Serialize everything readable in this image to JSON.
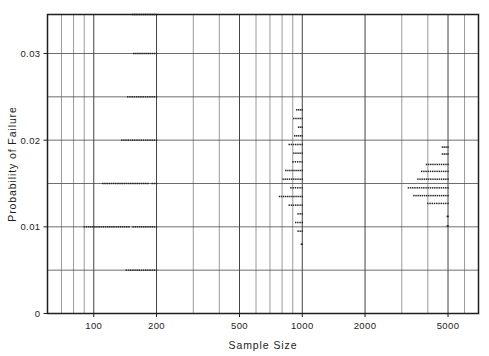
{
  "figure": {
    "name": "probability-of-failure-vs-sample-size-scatter"
  },
  "chart_data": {
    "type": "scatter",
    "title": "",
    "xlabel": "Sample Size",
    "ylabel": "Probability of Failure",
    "xscale": "log",
    "yscale": "linear",
    "xlim": [
      60,
      7000
    ],
    "ylim": [
      0,
      0.0345
    ],
    "grid": true,
    "legend": null,
    "x_ticks_labeled": [
      100,
      200,
      500,
      1000,
      2000,
      5000
    ],
    "x_tick_labels": [
      "100",
      "200",
      "500",
      "1000",
      "2000",
      "5000"
    ],
    "x_gridlines_minor": [
      70,
      80,
      90,
      100,
      200,
      300,
      400,
      500,
      600,
      700,
      800,
      900,
      1000,
      2000,
      3000,
      4000,
      5000,
      6000
    ],
    "y_ticks_labeled": [
      0,
      0.01,
      0.02,
      0.03
    ],
    "y_tick_labels": [
      "0",
      "0.01",
      "0.02",
      "0.03"
    ],
    "y_gridlines": [
      0,
      0.005,
      0.01,
      0.015,
      0.02,
      0.025,
      0.03
    ],
    "marker": "small-square-dot",
    "marker_color": "#262626",
    "clusters": [
      {
        "name": "cluster-n200",
        "x_right_edge": 200,
        "rows": [
          {
            "p": 0.0345,
            "x_start": 150,
            "x_end": 200
          },
          {
            "p": 0.03,
            "x_start": 152,
            "x_end": 200
          },
          {
            "p": 0.025,
            "x_start": 142,
            "x_end": 200
          },
          {
            "p": 0.02,
            "x_start": 133,
            "x_end": 200
          },
          {
            "p": 0.015,
            "x_start": 108,
            "x_end": 200
          },
          {
            "p": 0.01,
            "x_start": 88,
            "x_end": 200
          },
          {
            "p": 0.005,
            "x_start": 140,
            "x_end": 200
          }
        ]
      },
      {
        "name": "cluster-n1000",
        "x_right_edge": 1000,
        "rows": [
          {
            "p": 0.0235,
            "x_start": 940,
            "x_end": 1000
          },
          {
            "p": 0.0225,
            "x_start": 890,
            "x_end": 1000
          },
          {
            "p": 0.0215,
            "x_start": 960,
            "x_end": 1000
          },
          {
            "p": 0.0205,
            "x_start": 920,
            "x_end": 1000
          },
          {
            "p": 0.0195,
            "x_start": 845,
            "x_end": 1000
          },
          {
            "p": 0.0185,
            "x_start": 890,
            "x_end": 1000
          },
          {
            "p": 0.0175,
            "x_start": 880,
            "x_end": 1000
          },
          {
            "p": 0.0165,
            "x_start": 815,
            "x_end": 1000
          },
          {
            "p": 0.0155,
            "x_start": 790,
            "x_end": 1000
          },
          {
            "p": 0.0145,
            "x_start": 860,
            "x_end": 1000
          },
          {
            "p": 0.0135,
            "x_start": 760,
            "x_end": 1000
          },
          {
            "p": 0.0125,
            "x_start": 845,
            "x_end": 1000
          },
          {
            "p": 0.0115,
            "x_start": 955,
            "x_end": 1000
          },
          {
            "p": 0.0105,
            "x_start": 930,
            "x_end": 1000
          },
          {
            "p": 0.0095,
            "x_start": 955,
            "x_end": 1000
          },
          {
            "p": 0.008,
            "x_start": 990,
            "x_end": 1000
          }
        ]
      },
      {
        "name": "cluster-n5000",
        "x_right_edge": 5000,
        "rows": [
          {
            "p": 0.0192,
            "x_start": 4700,
            "x_end": 5000
          },
          {
            "p": 0.0184,
            "x_start": 4700,
            "x_end": 5000
          },
          {
            "p": 0.0172,
            "x_start": 3850,
            "x_end": 5000
          },
          {
            "p": 0.0164,
            "x_start": 3650,
            "x_end": 5000
          },
          {
            "p": 0.0155,
            "x_start": 3500,
            "x_end": 5000
          },
          {
            "p": 0.0145,
            "x_start": 3150,
            "x_end": 5000
          },
          {
            "p": 0.0136,
            "x_start": 3350,
            "x_end": 5000
          },
          {
            "p": 0.0127,
            "x_start": 3900,
            "x_end": 5000
          },
          {
            "p": 0.0112,
            "x_start": 4960,
            "x_end": 5000
          },
          {
            "p": 0.0101,
            "x_start": 4960,
            "x_end": 5000
          }
        ]
      }
    ]
  }
}
